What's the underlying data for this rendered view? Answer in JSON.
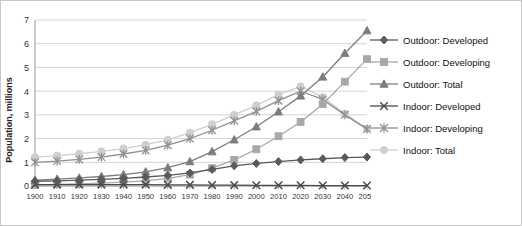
{
  "title": "",
  "chart_data": {
    "type": "line",
    "title": "",
    "xlabel": "",
    "ylabel": "Population, millions",
    "ylim": [
      0,
      7
    ],
    "yticks": [
      0,
      1,
      2,
      3,
      4,
      5,
      6,
      7
    ],
    "grid": true,
    "legend_position": "right",
    "categories": [
      1900,
      1910,
      1920,
      1930,
      1940,
      1950,
      1960,
      1970,
      1980,
      1990,
      2000,
      2010,
      2020,
      2030,
      2040,
      2050
    ],
    "xtick_labels": [
      "1900",
      "1910",
      "1920",
      "1930",
      "1940",
      "1950",
      "1960",
      "1970",
      "1980",
      "1990",
      "2000",
      "2010",
      "2020",
      "2030",
      "2040",
      "2050"
    ],
    "series": [
      {
        "name": "Outdoor: Developed",
        "marker": "diamond",
        "color": "#5a5a5a",
        "values": [
          0.2,
          0.22,
          0.25,
          0.28,
          0.32,
          0.38,
          0.45,
          0.55,
          0.7,
          0.85,
          0.95,
          1.03,
          1.1,
          1.15,
          1.2,
          1.22
        ]
      },
      {
        "name": "Outdoor: Developing",
        "marker": "square",
        "color": "#a8a8a8",
        "values": [
          0.05,
          0.07,
          0.09,
          0.12,
          0.16,
          0.22,
          0.32,
          0.48,
          0.75,
          1.1,
          1.55,
          2.1,
          2.7,
          3.45,
          4.4,
          5.35
        ]
      },
      {
        "name": "Outdoor: Total",
        "marker": "triangle",
        "color": "#7d7d7d",
        "values": [
          0.25,
          0.29,
          0.34,
          0.4,
          0.48,
          0.6,
          0.77,
          1.03,
          1.45,
          1.95,
          2.5,
          3.13,
          3.8,
          4.6,
          5.6,
          6.55
        ]
      },
      {
        "name": "Indoor: Developed",
        "marker": "x",
        "color": "#4a4a4a",
        "values": [
          0.06,
          0.06,
          0.06,
          0.06,
          0.06,
          0.06,
          0.05,
          0.05,
          0.04,
          0.04,
          0.03,
          0.03,
          0.03,
          0.02,
          0.02,
          0.02
        ]
      },
      {
        "name": "Indoor: Developing",
        "marker": "asterisk",
        "color": "#909090",
        "values": [
          1.0,
          1.05,
          1.12,
          1.22,
          1.35,
          1.5,
          1.72,
          2.0,
          2.35,
          2.75,
          3.15,
          3.6,
          4.0,
          3.65,
          3.0,
          2.4
        ]
      },
      {
        "name": "Indoor: Total",
        "marker": "circle",
        "color": "#cfcfcf",
        "values": [
          1.22,
          1.28,
          1.36,
          1.46,
          1.58,
          1.74,
          1.95,
          2.25,
          2.6,
          3.0,
          3.4,
          3.85,
          4.2,
          3.75,
          3.05,
          2.42
        ]
      }
    ]
  },
  "legend": {
    "items": [
      {
        "label": "Outdoor: Developed"
      },
      {
        "label": "Outdoor: Developing"
      },
      {
        "label": "Outdoor: Total"
      },
      {
        "label": "Indoor: Developed"
      },
      {
        "label": "Indoor: Developing"
      },
      {
        "label": "Indoor: Total"
      }
    ]
  }
}
